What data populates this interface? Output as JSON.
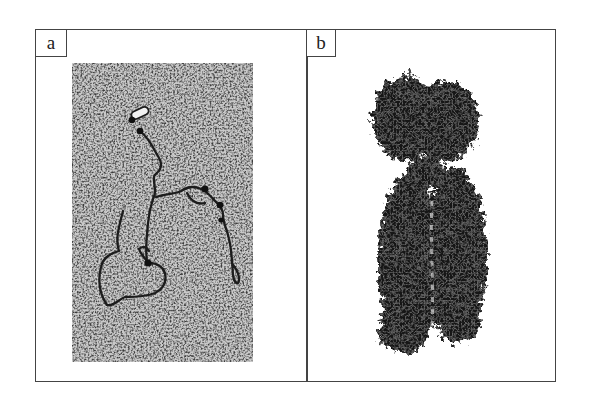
{
  "figure": {
    "panels": [
      {
        "label": "a",
        "content": "electron-micrograph-dna-strands"
      },
      {
        "label": "b",
        "content": "condensed-chromosome-micrograph"
      }
    ]
  }
}
